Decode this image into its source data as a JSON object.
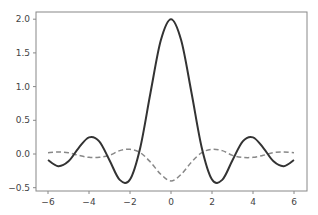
{
  "chart_data": {
    "type": "line",
    "title": "",
    "xlabel": "",
    "ylabel": "",
    "xlim": [
      -6.6,
      6.6
    ],
    "ylim": [
      -0.55,
      2.1
    ],
    "grid": false,
    "legend": null,
    "xticks": [
      -6,
      -4,
      -2,
      0,
      2,
      4,
      6
    ],
    "xtick_labels": [
      "−6",
      "−4",
      "−2",
      "0",
      "2",
      "4",
      "6"
    ],
    "yticks": [
      -0.5,
      0.0,
      0.5,
      1.0,
      1.5,
      2.0
    ],
    "ytick_labels": [
      "−0.5",
      "0.0",
      "0.5",
      "1.0",
      "1.5",
      "2.0"
    ],
    "x": [
      -6,
      -5.5,
      -5,
      -4.5,
      -4,
      -3.5,
      -3,
      -2.5,
      -2,
      -1.5,
      -1,
      -0.5,
      0,
      0.5,
      1,
      1.5,
      2,
      2.5,
      3,
      3.5,
      4,
      4.5,
      5,
      5.5,
      6
    ],
    "series": [
      {
        "name": "solid",
        "style": "solid",
        "color": "#333333",
        "width": 2,
        "values": [
          -0.089,
          -0.181,
          -0.109,
          0.092,
          0.247,
          0.188,
          -0.093,
          -0.384,
          -0.378,
          0.094,
          0.909,
          1.683,
          2.0,
          1.683,
          0.909,
          0.094,
          -0.378,
          -0.384,
          -0.093,
          0.188,
          0.247,
          0.092,
          -0.109,
          -0.181,
          -0.089
        ]
      },
      {
        "name": "dashed",
        "style": "dashed",
        "color": "#888888",
        "width": 1.5,
        "values": [
          0.02,
          0.03,
          0.02,
          -0.02,
          -0.05,
          -0.05,
          -0.02,
          0.05,
          0.07,
          0.02,
          -0.12,
          -0.3,
          -0.4,
          -0.3,
          -0.12,
          0.02,
          0.07,
          0.05,
          -0.02,
          -0.05,
          -0.05,
          -0.02,
          0.02,
          0.03,
          0.02
        ]
      }
    ]
  }
}
